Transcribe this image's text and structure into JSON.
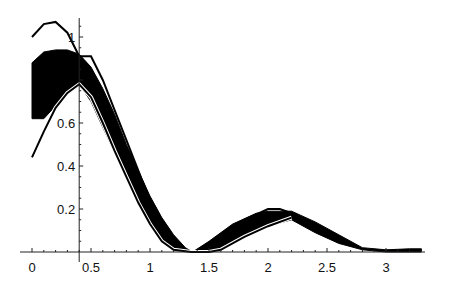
{
  "chart_data": {
    "type": "area",
    "title": "",
    "xlabel": "",
    "ylabel": "",
    "xlim": [
      0,
      3.3
    ],
    "ylim": [
      0,
      1.08
    ],
    "grid": false,
    "legend": null,
    "axes_origin": {
      "x": 0.4,
      "y": 0
    },
    "x_ticks": [
      {
        "value": 0,
        "label": "0"
      },
      {
        "value": 0.5,
        "label": "0.5"
      },
      {
        "value": 1,
        "label": "1"
      },
      {
        "value": 1.5,
        "label": "1.5"
      },
      {
        "value": 2,
        "label": "2"
      },
      {
        "value": 2.5,
        "label": "2.5"
      },
      {
        "value": 3,
        "label": "3"
      }
    ],
    "y_ticks": [
      {
        "value": 0.2,
        "label": "0.2"
      },
      {
        "value": 0.4,
        "label": "0.4"
      },
      {
        "value": 0.6,
        "label": "0.6"
      },
      {
        "value": 1,
        "label": "1"
      }
    ],
    "series": [
      {
        "name": "band",
        "kind": "filled-band",
        "color": "#000000",
        "upper": [
          [
            0,
            0.88
          ],
          [
            0.1,
            0.93
          ],
          [
            0.2,
            0.94
          ],
          [
            0.3,
            0.94
          ],
          [
            0.4,
            0.92
          ],
          [
            0.5,
            0.86
          ],
          [
            0.6,
            0.76
          ],
          [
            0.7,
            0.64
          ],
          [
            0.8,
            0.5
          ],
          [
            0.9,
            0.38
          ],
          [
            1.0,
            0.26
          ],
          [
            1.1,
            0.16
          ],
          [
            1.2,
            0.08
          ],
          [
            1.3,
            0.02
          ],
          [
            1.36,
            0.0
          ],
          [
            1.5,
            0.05
          ],
          [
            1.7,
            0.13
          ],
          [
            1.9,
            0.18
          ],
          [
            2.0,
            0.19
          ],
          [
            2.2,
            0.19
          ],
          [
            2.4,
            0.14
          ],
          [
            2.6,
            0.08
          ],
          [
            2.8,
            0.02
          ],
          [
            3.0,
            0.01
          ],
          [
            3.2,
            0.015
          ],
          [
            3.3,
            0.015
          ]
        ],
        "lower": [
          [
            0,
            0.62
          ],
          [
            0.1,
            0.62
          ],
          [
            0.2,
            0.68
          ],
          [
            0.3,
            0.74
          ],
          [
            0.4,
            0.78
          ],
          [
            0.5,
            0.7
          ],
          [
            0.6,
            0.58
          ],
          [
            0.7,
            0.46
          ],
          [
            0.8,
            0.34
          ],
          [
            0.9,
            0.22
          ],
          [
            1.0,
            0.13
          ],
          [
            1.1,
            0.06
          ],
          [
            1.2,
            0.02
          ],
          [
            1.36,
            0.0
          ],
          [
            1.5,
            0.0
          ],
          [
            1.6,
            0.02
          ],
          [
            1.8,
            0.08
          ],
          [
            2.0,
            0.12
          ],
          [
            2.2,
            0.15
          ],
          [
            2.4,
            0.09
          ],
          [
            2.6,
            0.04
          ],
          [
            2.8,
            0.01
          ],
          [
            3.0,
            0.0
          ],
          [
            3.3,
            0.0
          ]
        ]
      },
      {
        "name": "outer-upper-curve",
        "kind": "line",
        "color": "#000000",
        "points": [
          [
            0,
            1.0
          ],
          [
            0.1,
            1.06
          ],
          [
            0.2,
            1.07
          ],
          [
            0.3,
            1.02
          ],
          [
            0.4,
            0.91
          ],
          [
            0.5,
            0.91
          ],
          [
            0.6,
            0.8
          ],
          [
            0.7,
            0.66
          ],
          [
            0.8,
            0.52
          ],
          [
            0.9,
            0.38
          ],
          [
            1.0,
            0.24
          ],
          [
            1.1,
            0.12
          ],
          [
            1.2,
            0.04
          ],
          [
            1.3,
            0.0
          ],
          [
            1.4,
            0.0
          ],
          [
            1.6,
            0.06
          ],
          [
            1.8,
            0.15
          ],
          [
            2.0,
            0.2
          ],
          [
            2.1,
            0.2
          ],
          [
            2.2,
            0.18
          ]
        ]
      },
      {
        "name": "outer-lower-curve",
        "kind": "line",
        "color": "#000000",
        "points": [
          [
            0,
            0.44
          ],
          [
            0.1,
            0.56
          ],
          [
            0.2,
            0.67
          ],
          [
            0.3,
            0.74
          ],
          [
            0.4,
            0.78
          ],
          [
            0.5,
            0.72
          ],
          [
            0.6,
            0.6
          ],
          [
            0.7,
            0.47
          ],
          [
            0.8,
            0.35
          ],
          [
            0.9,
            0.23
          ],
          [
            1.0,
            0.13
          ],
          [
            1.1,
            0.05
          ],
          [
            1.2,
            0.01
          ],
          [
            1.35,
            0.0
          ],
          [
            1.5,
            0.0
          ],
          [
            1.6,
            0.01
          ],
          [
            1.8,
            0.07
          ],
          [
            2.0,
            0.12
          ],
          [
            2.2,
            0.16
          ]
        ]
      }
    ]
  }
}
